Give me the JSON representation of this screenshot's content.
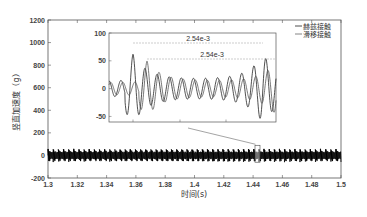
{
  "chart_data": {
    "type": "line",
    "title": "",
    "xlabel": "时间(s)",
    "ylabel": "竖直加速度（g）",
    "xlim": [
      1.3,
      1.5
    ],
    "ylim": [
      -200,
      1200
    ],
    "x_ticks": [
      "1.3",
      "1.32",
      "1.34",
      "1.36",
      "1.38",
      "1.4",
      "1.42",
      "1.44",
      "1.46",
      "1.48",
      "1.5"
    ],
    "y_ticks": [
      "-200",
      "0",
      "200",
      "400",
      "600",
      "800",
      "1000",
      "1200"
    ],
    "grid": false,
    "legend": {
      "position": "upper right",
      "entries": [
        "赫兹接触",
        "滑移接触"
      ]
    },
    "series": [
      {
        "name": "赫兹接触",
        "description": "dense oscillation around 0 with amplitude about ±60 g, periodic bursts every ~2.54e-3 s"
      },
      {
        "name": "滑移接触",
        "description": "dense oscillation around 0 with amplitude about ±60 g, periodic bursts every ~2.54e-3 s"
      }
    ],
    "zoom_box": {
      "x_center": 1.443,
      "y_range": [
        -60,
        90
      ]
    },
    "inset": {
      "ylim": [
        -60,
        100
      ],
      "y_ticks": [
        "100",
        "50",
        "0",
        "-50"
      ],
      "annotations": [
        {
          "label": "2.54e-3",
          "description": "period between large peaks (赫兹接触)"
        },
        {
          "label": "2.54e-3",
          "description": "period between large peaks (滑移接触)"
        }
      ],
      "peak_values": {
        "max": 62,
        "min": -57
      }
    }
  },
  "labels": {
    "xlabel": "时间(s)",
    "ylabel": "竖直加速度（g）",
    "legend_1": "赫兹接触",
    "legend_2": "滑移接触",
    "annot_1": "2.54e-3",
    "annot_2": "2.54e-3"
  }
}
